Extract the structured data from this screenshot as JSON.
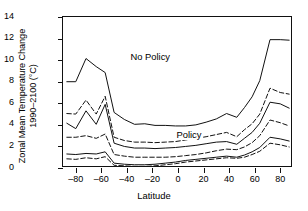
{
  "chart_data": {
    "type": "line",
    "title": "",
    "xlabel": "Latitude",
    "ylabel": "Zonal Mean Temperature Change 1990–2100 (°C)",
    "ylabel_line1": "Zonal Mean Temperature Change",
    "ylabel_line2": "1990–2100 (°C)",
    "xlim": [
      -90,
      90
    ],
    "ylim": [
      0,
      14
    ],
    "xticks": [
      -80,
      -60,
      -40,
      -20,
      0,
      20,
      40,
      60,
      80
    ],
    "xticklabels": [
      "–80",
      "–60",
      "–40",
      "–20",
      "0",
      "20",
      "40",
      "60",
      "80"
    ],
    "yticks": [
      0,
      2,
      4,
      6,
      8,
      10,
      12,
      14
    ],
    "yticklabels": [
      "0",
      "2",
      "4",
      "6",
      "8",
      "10",
      "12",
      "14"
    ],
    "grid": false,
    "legend": "none",
    "annotations": [
      {
        "text": "No Policy",
        "x": -38,
        "y": 10.3
      },
      {
        "text": "Policy",
        "x": -2,
        "y": 3.05
      }
    ],
    "x": [
      -87,
      -80,
      -72,
      -64,
      -57,
      -50,
      -42,
      -34,
      -26,
      -18,
      -10,
      -2,
      6,
      14,
      22,
      30,
      38,
      46,
      52,
      58,
      64,
      72,
      80,
      87
    ],
    "series": [
      {
        "name": "No Policy upper bound",
        "style": "solid",
        "values": [
          8.0,
          8.0,
          10.15,
          9.4,
          8.85,
          5.15,
          4.5,
          4.05,
          4.1,
          3.95,
          3.95,
          3.9,
          3.9,
          4.0,
          4.25,
          4.55,
          5.05,
          4.7,
          5.6,
          6.6,
          8.1,
          11.9,
          11.9,
          11.85
        ]
      },
      {
        "name": "No Policy upper-mid bound",
        "style": "dashed",
        "values": [
          5.05,
          5.0,
          6.3,
          5.0,
          6.65,
          2.85,
          2.55,
          2.4,
          2.4,
          2.35,
          2.4,
          2.45,
          2.6,
          2.75,
          2.9,
          3.1,
          3.3,
          2.9,
          3.55,
          4.1,
          5.0,
          7.4,
          7.0,
          6.85
        ]
      },
      {
        "name": "No Policy central estimate",
        "style": "solid",
        "values": [
          4.15,
          3.65,
          5.3,
          4.05,
          5.9,
          2.3,
          2.0,
          1.85,
          1.85,
          1.8,
          1.85,
          1.9,
          2.0,
          2.1,
          2.25,
          2.4,
          2.45,
          2.2,
          2.75,
          3.3,
          4.15,
          6.1,
          5.95,
          5.55
        ]
      },
      {
        "name": "Policy upper bound",
        "style": "dashed",
        "values": [
          2.85,
          2.85,
          3.0,
          2.75,
          3.15,
          1.25,
          1.1,
          1.0,
          1.0,
          1.0,
          1.0,
          1.05,
          1.15,
          1.25,
          1.4,
          1.6,
          1.75,
          1.7,
          1.95,
          2.35,
          3.0,
          4.45,
          4.2,
          3.9
        ]
      },
      {
        "name": "Policy central estimate",
        "style": "solid",
        "values": [
          1.3,
          1.25,
          1.35,
          1.3,
          1.5,
          0.45,
          0.35,
          0.3,
          0.3,
          0.35,
          0.45,
          0.55,
          0.7,
          0.8,
          0.9,
          1.0,
          1.1,
          1.0,
          1.2,
          1.5,
          1.9,
          2.85,
          2.7,
          2.5
        ]
      },
      {
        "name": "Policy lower bound",
        "style": "dashed",
        "values": [
          0.85,
          0.8,
          0.95,
          0.85,
          1.05,
          0.25,
          0.2,
          0.15,
          0.15,
          0.2,
          0.3,
          0.4,
          0.55,
          0.65,
          0.75,
          0.85,
          0.95,
          0.9,
          1.0,
          1.25,
          1.55,
          2.3,
          2.15,
          1.95
        ]
      }
    ],
    "colors": {
      "line": "#111111",
      "background": "#ffffff",
      "axis": "#111111"
    }
  }
}
